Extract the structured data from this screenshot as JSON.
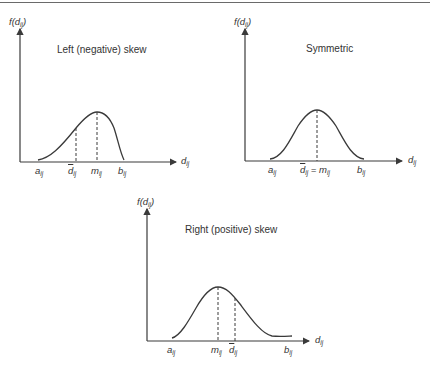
{
  "panels": [
    {
      "id": "left-skew",
      "title": "Left (negative) skew",
      "y_axis_label": {
        "main": "f(d",
        "sub": "ij",
        "close": ")"
      },
      "x_axis_label": {
        "main": "d",
        "sub": "ij"
      },
      "ticks": [
        {
          "main": "a",
          "sub": "ij"
        },
        {
          "main": "d",
          "sub": "ij",
          "bar": true
        },
        {
          "main": "m",
          "sub": "ij"
        },
        {
          "main": "b",
          "sub": "ij"
        }
      ]
    },
    {
      "id": "symmetric",
      "title": "Symmetric",
      "y_axis_label": {
        "main": "f(d",
        "sub": "ij",
        "close": ")"
      },
      "x_axis_label": {
        "main": "d",
        "sub": "ij"
      },
      "ticks": [
        {
          "main": "a",
          "sub": "ij"
        },
        {
          "main": "d",
          "sub": "ij",
          "bar": true,
          "eq": " = m",
          "eq_sub": "ij"
        },
        {
          "main": "b",
          "sub": "ij"
        }
      ]
    },
    {
      "id": "right-skew",
      "title": "Right (positive) skew",
      "y_axis_label": {
        "main": "f(d",
        "sub": "ij",
        "close": ")"
      },
      "x_axis_label": {
        "main": "d",
        "sub": "ij"
      },
      "ticks": [
        {
          "main": "a",
          "sub": "ij"
        },
        {
          "main": "m",
          "sub": "ij"
        },
        {
          "main": "d",
          "sub": "ij",
          "bar": true
        },
        {
          "main": "b",
          "sub": "ij"
        }
      ]
    }
  ],
  "colors": {
    "line": "#3a3a3a",
    "text": "#333333",
    "rule": "#6a6a6a"
  }
}
